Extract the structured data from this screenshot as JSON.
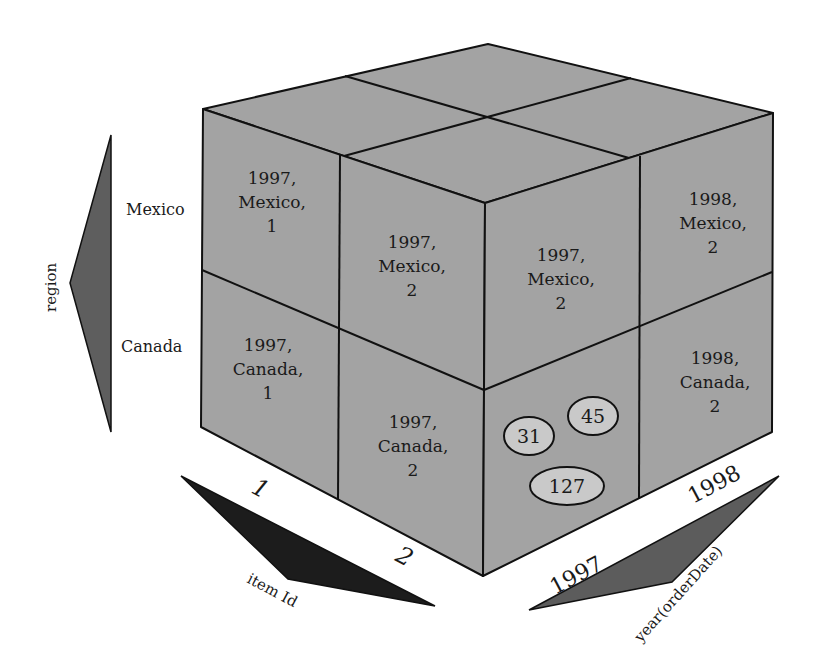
{
  "diagram": {
    "type": "olap-data-cube",
    "dimensions": {
      "region": {
        "label": "region",
        "members": [
          "Mexico",
          "Canada"
        ]
      },
      "item_id": {
        "label": "item Id",
        "members": [
          "1",
          "2"
        ]
      },
      "year": {
        "label": "year(orderDate)",
        "members": [
          "1997",
          "1998"
        ]
      }
    },
    "left_face_cells": [
      {
        "line1": "1997,",
        "line2": "Mexico,",
        "line3": "1"
      },
      {
        "line1": "1997,",
        "line2": "Mexico,",
        "line3": "2"
      },
      {
        "line1": "1997,",
        "line2": "Canada,",
        "line3": "1"
      },
      {
        "line1": "1997,",
        "line2": "Canada,",
        "line3": "2"
      }
    ],
    "right_face_cells": [
      {
        "line1": "1997,",
        "line2": "Mexico,",
        "line3": "2"
      },
      {
        "line1": "1998,",
        "line2": "Mexico,",
        "line3": "2"
      },
      {
        "line1": "1998,",
        "line2": "Canada,",
        "line3": "2"
      }
    ],
    "highlighted_cell": {
      "year": "1997",
      "region": "Canada",
      "item_id": "2",
      "values": [
        "31",
        "45",
        "127"
      ]
    },
    "colors": {
      "cube_face": "#a3a3a3",
      "edges": "#111111",
      "bubble_fill": "#c9c9c9",
      "item_arrow": "#1c1c1c",
      "year_arrow": "#5c5c5c",
      "region_arrow": "#5e5e5e"
    }
  }
}
